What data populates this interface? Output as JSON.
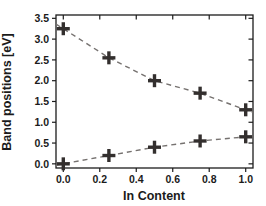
{
  "figure": {
    "background": "#ffffff"
  },
  "chart_data": {
    "type": "scatter",
    "title": "",
    "xlabel": "In Content",
    "ylabel": "Band positions [eV]",
    "x": [
      0.0,
      0.25,
      0.5,
      0.75,
      1.0
    ],
    "series": [
      {
        "name": "upper-band-edge",
        "values": [
          3.25,
          2.55,
          2.0,
          1.7,
          1.3
        ]
      },
      {
        "name": "lower-band-edge",
        "values": [
          0.0,
          0.2,
          0.4,
          0.55,
          0.65
        ]
      }
    ],
    "x_ticks": [
      0.0,
      0.2,
      0.4,
      0.6,
      0.8,
      1.0
    ],
    "y_ticks": [
      0.0,
      0.5,
      1.0,
      1.5,
      2.0,
      2.5,
      3.0,
      3.5
    ],
    "xlim": [
      -0.04,
      1.04
    ],
    "ylim": [
      -0.1,
      3.58
    ],
    "grid": false,
    "legend": "none",
    "marker": "plus",
    "line_style": "dashed",
    "colors": {
      "marker": "#332f2e",
      "line": "#767270",
      "axis": "#1c1c1c",
      "text": "#1b1b1b"
    }
  }
}
